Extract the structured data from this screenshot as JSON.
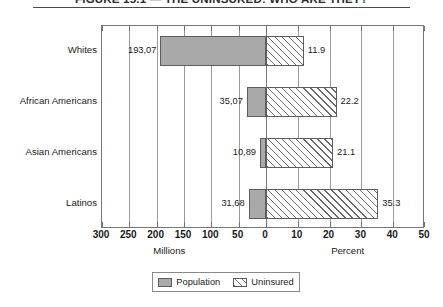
{
  "title": "FIGURE 15.1 — THE UNINSURED: WHO ARE THEY?",
  "chart_data": {
    "type": "bar",
    "orientation": "horizontal",
    "style": "bidirectional",
    "title": "FIGURE 15.1 — THE UNINSURED: WHO ARE THEY?",
    "categories": [
      "Whites",
      "African Americans",
      "Asian Americans",
      "Latinos"
    ],
    "series": [
      {
        "name": "Population",
        "axis": "left",
        "unit": "Millions",
        "direction": "left",
        "fill": "solid-gray",
        "values": [
          193.07,
          35.07,
          10.89,
          31.68
        ],
        "value_labels": [
          "193,07",
          "35,07",
          "10,89",
          "31,68"
        ]
      },
      {
        "name": "Uninsured",
        "axis": "right",
        "unit": "Percent",
        "direction": "right",
        "fill": "diagonal-hatch",
        "values": [
          11.9,
          22.2,
          21.1,
          35.3
        ],
        "value_labels": [
          "11.9",
          "22.2",
          "21.1",
          "35.3"
        ]
      }
    ],
    "left_axis": {
      "label": "Millions",
      "ticks": [
        300,
        250,
        200,
        150,
        100,
        50,
        0
      ],
      "tick_labels": [
        "300",
        "250",
        "200",
        "150",
        "100",
        "50",
        "0"
      ],
      "range": [
        300,
        0
      ],
      "reversed": true
    },
    "right_axis": {
      "label": "Percent",
      "ticks": [
        0,
        10,
        20,
        30,
        40,
        50
      ],
      "tick_labels": [
        "0",
        "10",
        "20",
        "30",
        "40",
        "50"
      ],
      "range": [
        0,
        50
      ]
    },
    "grid": true,
    "legend": {
      "position": "bottom-center",
      "entries": [
        "Population",
        "Uninsured"
      ]
    }
  },
  "axis": {
    "left_title": "Millions",
    "right_title": "Percent",
    "tick_labels": [
      "300",
      "250",
      "200",
      "150",
      "100",
      "50",
      "0",
      "10",
      "20",
      "30",
      "40",
      "50"
    ]
  },
  "legend": {
    "population_label": "Population",
    "uninsured_label": "Uninsured"
  },
  "colors": {
    "population_fill": "#a9a9a9",
    "uninsured_hatch": "#6b6b6b",
    "bar_border": "#5d5d5d",
    "gridline": "#9a9a9a",
    "frame": "#777777"
  }
}
